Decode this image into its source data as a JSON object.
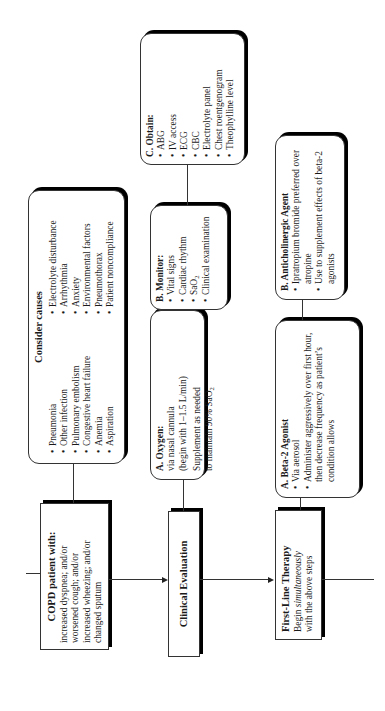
{
  "start": {
    "title": "COPD patient with:",
    "lines": [
      "increased dyspnea; and/or",
      "worsened cough; and/or",
      "increased wheezing; and/or",
      "changed sputum"
    ]
  },
  "causes": {
    "title": "Consider causes",
    "left": [
      "Pneumonia",
      "Other infection",
      "Pulmonary embolism",
      "Congestive heart failure",
      "Anemia",
      "Aspiration"
    ],
    "right": [
      "Electrolyte disturbance",
      "Arrhythmia",
      "Anxiety",
      "Environmental factors",
      "Pneumothorax",
      "Patient noncompliance"
    ]
  },
  "evaluation": {
    "title": "Clinical Evaluation",
    "oxygen": {
      "title": "A.  Oxygen:",
      "lines": [
        "via nasal cannula",
        "(begin with 1–1.5 L/min)"
      ],
      "note_1": "Supplement as needed",
      "note_2_prefix": "to maintain 90% SaO",
      "note_2_sub": "2"
    },
    "monitor": {
      "title": "B.  Monitor:",
      "items": [
        "Vital signs",
        "Cardiac rhythm"
      ],
      "sao2_prefix": "SaO",
      "sao2_sub": "2",
      "last": "Clinical examination"
    },
    "obtain": {
      "title": "C. Obtain:",
      "items": [
        "ABG",
        "IV access",
        "ECG",
        "CBC",
        "Electrolyte panel",
        "Chest roentgenogram",
        "Theophylline level"
      ]
    }
  },
  "therapy": {
    "title": "First-Line Therapy",
    "sub_1": "Begin ",
    "sub_1_em": "simultaneously",
    "sub_2": "with the above steps",
    "beta": {
      "title": "A.  Beta-2 Agonist",
      "items": [
        "Via aerosol",
        "Administer aggressively over first hour, then decrease frequency as patient’s condition allows"
      ]
    },
    "anticholinergic": {
      "title": "B.  Anticholinergic Agent",
      "items": [
        "Ipratropium bromide preferred over atropine",
        "Use to supplement effects of beta-2 agonists"
      ]
    }
  }
}
